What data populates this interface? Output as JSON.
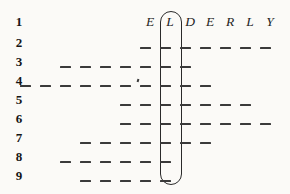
{
  "puzzle": {
    "type": "word-blank-grid",
    "answer_word": "ELDERLY",
    "answer_letters": [
      "E",
      "L",
      "D",
      "E",
      "R",
      "L",
      "Y"
    ],
    "highlighted_column_index": 1,
    "highlighted_letter": "L",
    "row_numbers": [
      "1",
      "2",
      "3",
      "4",
      "5",
      "6",
      "7",
      "8",
      "9"
    ],
    "column_pitch_px": 20,
    "row_pitch_px": 19,
    "letter_row_y": 22,
    "first_letter_x": 150,
    "rows": [
      {
        "number": "1",
        "kind": "letters",
        "y": 22,
        "blank_count": 0,
        "first_blank_col": null,
        "last_blank_col": null
      },
      {
        "number": "2",
        "kind": "blanks",
        "y": 43,
        "blank_count": 7,
        "first_blank_col": 0,
        "last_blank_col": 6,
        "blank_x": [
          145,
          165,
          185,
          205,
          225,
          245,
          265
        ]
      },
      {
        "number": "3",
        "kind": "blanks",
        "y": 62,
        "blank_count": 7,
        "first_blank_col": -4,
        "last_blank_col": 2,
        "blank_x": [
          65,
          85,
          105,
          125,
          145,
          165,
          185
        ]
      },
      {
        "number": "4",
        "kind": "blanks",
        "y": 81,
        "blank_count": 9,
        "first_blank_col": -6,
        "last_blank_col": 4,
        "blank_x": [
          25,
          45,
          65,
          85,
          105,
          125,
          145,
          165,
          185,
          205
        ],
        "has_apostrophe": true,
        "apostrophe_x": 137
      },
      {
        "number": "5",
        "kind": "blanks",
        "y": 100,
        "blank_count": 6,
        "first_blank_col": 0,
        "last_blank_col": 5,
        "blank_x": [
          125,
          145,
          165,
          185,
          205,
          225,
          245
        ]
      },
      {
        "number": "6",
        "kind": "blanks",
        "y": 119,
        "blank_count": 8,
        "first_blank_col": 0,
        "last_blank_col": 7,
        "blank_x": [
          125,
          145,
          165,
          185,
          205,
          225,
          245,
          265
        ]
      },
      {
        "number": "7",
        "kind": "blanks",
        "y": 138,
        "blank_count": 7,
        "first_blank_col": -2,
        "last_blank_col": 4,
        "blank_x": [
          85,
          105,
          125,
          145,
          165,
          185,
          205
        ]
      },
      {
        "number": "8",
        "kind": "blanks",
        "y": 157,
        "blank_count": 6,
        "first_blank_col": -3,
        "last_blank_col": 1,
        "blank_x": [
          65,
          85,
          105,
          125,
          145,
          165
        ]
      },
      {
        "number": "9",
        "kind": "blanks",
        "y": 176,
        "blank_count": 5,
        "first_blank_col": -2,
        "last_blank_col": 1,
        "blank_x": [
          85,
          105,
          125,
          145,
          165
        ]
      }
    ],
    "oval": {
      "x": 160,
      "y": 11,
      "width": 22,
      "height": 174,
      "encloses_column": "L"
    },
    "colors": {
      "background": "#fbfaf7",
      "ink": "#2a2a2a",
      "dash": "#3a3a3a",
      "number": "#151515"
    }
  }
}
